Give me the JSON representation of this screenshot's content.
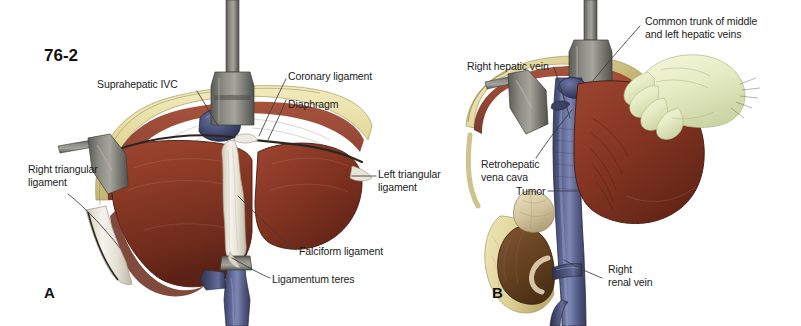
{
  "figure": {
    "number": "76-2",
    "panels": [
      {
        "letter": "A"
      },
      {
        "letter": "B"
      }
    ]
  },
  "panel_a": {
    "letter": "A",
    "labels": [
      {
        "name": "suprahepatic-ivc",
        "text": "Suprahepatic IVC"
      },
      {
        "name": "coronary-ligament",
        "text": "Coronary ligament"
      },
      {
        "name": "diaphragm",
        "text": "Diaphragm"
      },
      {
        "name": "left-triangular-ligament",
        "line1": "Left triangular",
        "line2": "ligament"
      },
      {
        "name": "right-triangular-ligament",
        "line1": "Right triangular",
        "line2": "ligament"
      },
      {
        "name": "falciform-ligament",
        "text": "Falciform ligament"
      },
      {
        "name": "ligamentum-teres",
        "text": "Ligamentum teres"
      }
    ]
  },
  "panel_b": {
    "letter": "B",
    "labels": [
      {
        "name": "common-trunk-hepatic-veins",
        "line1": "Common trunk of middle",
        "line2": "and left hepatic veins"
      },
      {
        "name": "right-hepatic-vein",
        "text": "Right hepatic vein"
      },
      {
        "name": "retrohepatic-vena-cava",
        "line1": "Retrohepatic",
        "line2": "vena cava"
      },
      {
        "name": "tumor",
        "text": "Tumor"
      },
      {
        "name": "right-renal-vein",
        "line1": "Right",
        "line2": "renal vein"
      }
    ]
  },
  "colors": {
    "liver": "#8B3A26",
    "liver_dark": "#5E2414",
    "liver_light": "#A8492F",
    "fat": "#E8DFA8",
    "fat_shadow": "#C9BC78",
    "vein_blue": "#4A5280",
    "vein_blue_light": "#7A83AC",
    "retractor": "#6E6E68",
    "retractor_light": "#9A9A93",
    "ligament_white": "#EFEDE6",
    "glove": "#E9EECB",
    "kidney": "#6B4428",
    "tumor": "#D8CBA4",
    "label_text": "#1b1b1b",
    "leader_line": "#3a3a3a",
    "background": "#ffffff"
  }
}
